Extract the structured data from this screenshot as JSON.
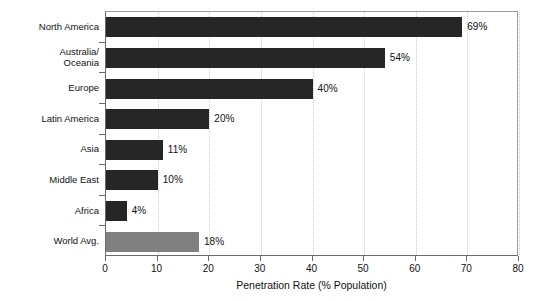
{
  "chart_data": {
    "type": "bar",
    "orientation": "horizontal",
    "title": "",
    "xlabel": "Penetration Rate (% Population)",
    "ylabel": "",
    "xlim": [
      0,
      80
    ],
    "xticks": [
      0,
      10,
      20,
      30,
      40,
      50,
      60,
      70,
      80
    ],
    "xtick_labels": [
      "0",
      "10",
      "20",
      "30",
      "40",
      "50",
      "60",
      "70",
      "80"
    ],
    "grid": "vertical-dotted",
    "legend": "none",
    "categories": [
      "North America",
      "Australia/\nOceania",
      "Europe",
      "Latin America",
      "Asia",
      "Middle East",
      "Africa",
      "World Avg."
    ],
    "values": [
      69,
      54,
      40,
      20,
      11,
      10,
      4,
      18
    ],
    "data_labels": [
      "69%",
      "54%",
      "40%",
      "20%",
      "11%",
      "10%",
      "4%",
      "18%"
    ],
    "bar_colors": [
      "#262626",
      "#262626",
      "#262626",
      "#262626",
      "#262626",
      "#262626",
      "#262626",
      "#808080"
    ],
    "highlight_category": "World Avg.",
    "highlight_color": "#808080",
    "series_color": "#262626",
    "background": "#ffffff",
    "grid_color": "#c9c9c9",
    "axis_color": "#6b6b6b"
  }
}
